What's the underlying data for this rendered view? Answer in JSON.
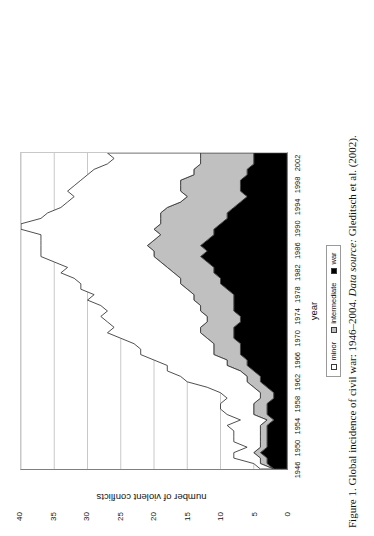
{
  "figure": {
    "caption_prefix": "Figure 1.",
    "caption_main": "Global incidence of civil war: 1946–2004.",
    "caption_source_label": "Data source:",
    "caption_source_value": "Gleditsch et al. (2002)."
  },
  "axes": {
    "x_title": "year",
    "y_title": "number of violent conflicts",
    "y_ticks": [
      "0",
      "5",
      "10",
      "15",
      "20",
      "25",
      "30",
      "35",
      "40"
    ],
    "x_ticks": [
      "1946",
      "1950",
      "1954",
      "1958",
      "1962",
      "1966",
      "1970",
      "1974",
      "1978",
      "1982",
      "1986",
      "1990",
      "1994",
      "1998",
      "2002"
    ]
  },
  "legend": {
    "entries": [
      {
        "label": "minor",
        "color": "#ffffff"
      },
      {
        "label": "intermediate",
        "color": "#c0c0c0"
      },
      {
        "label": "war",
        "color": "#000000"
      }
    ]
  },
  "colors": {
    "war": "#000000",
    "intermediate": "#c0c0c0",
    "minor": "#ffffff",
    "outline": "#3a3a3a",
    "gridline": "#c8c8c8",
    "axis": "#808080"
  },
  "chart_data": {
    "type": "area",
    "stacked": true,
    "title": "Global incidence of civil war: 1946–2004",
    "xlabel": "year",
    "ylabel": "number of violent conflicts",
    "xlim": [
      1946,
      2004
    ],
    "ylim": [
      0,
      40
    ],
    "grid": true,
    "legend_position": "bottom",
    "orientation": "rotated-90-ccw",
    "x": [
      1946,
      1947,
      1948,
      1949,
      1950,
      1951,
      1952,
      1953,
      1954,
      1955,
      1956,
      1957,
      1958,
      1959,
      1960,
      1961,
      1962,
      1963,
      1964,
      1965,
      1966,
      1967,
      1968,
      1969,
      1970,
      1971,
      1972,
      1973,
      1974,
      1975,
      1976,
      1977,
      1978,
      1979,
      1980,
      1981,
      1982,
      1983,
      1984,
      1985,
      1986,
      1987,
      1988,
      1989,
      1990,
      1991,
      1992,
      1993,
      1994,
      1995,
      1996,
      1997,
      1998,
      1999,
      2000,
      2001,
      2002,
      2003,
      2004
    ],
    "series": [
      {
        "name": "war",
        "color": "#000000",
        "values": [
          2,
          3,
          3,
          4,
          3,
          3,
          3,
          3,
          3,
          2,
          3,
          3,
          3,
          2,
          2,
          3,
          4,
          4,
          5,
          6,
          6,
          7,
          7,
          7,
          8,
          8,
          8,
          7,
          7,
          8,
          8,
          8,
          8,
          9,
          10,
          10,
          11,
          11,
          12,
          13,
          12,
          13,
          12,
          11,
          11,
          10,
          9,
          9,
          8,
          7,
          6,
          7,
          7,
          7,
          6,
          6,
          5,
          5,
          5
        ]
      },
      {
        "name": "intermediate",
        "color": "#c0c0c0",
        "values": [
          0,
          1,
          1,
          1,
          1,
          1,
          1,
          1,
          1,
          1,
          2,
          2,
          2,
          2,
          2,
          2,
          2,
          2,
          2,
          3,
          3,
          4,
          4,
          4,
          4,
          5,
          5,
          5,
          5,
          5,
          5,
          6,
          6,
          6,
          6,
          6,
          6,
          7,
          7,
          7,
          8,
          8,
          8,
          8,
          9,
          9,
          10,
          10,
          10,
          9,
          9,
          9,
          9,
          9,
          8,
          8,
          8,
          8,
          8
        ]
      },
      {
        "name": "minor",
        "color": "#ffffff",
        "values": [
          2,
          1,
          4,
          3,
          2,
          4,
          4,
          4,
          5,
          4,
          4,
          5,
          5,
          5,
          6,
          7,
          9,
          10,
          11,
          9,
          11,
          11,
          11,
          12,
          13,
          14,
          13,
          15,
          16,
          14,
          15,
          16,
          15,
          16,
          15,
          16,
          17,
          15,
          16,
          17,
          17,
          16,
          17,
          18,
          20,
          21,
          18,
          17,
          16,
          17,
          17,
          17,
          16,
          15,
          16,
          15,
          14,
          13,
          14
        ]
      }
    ]
  }
}
